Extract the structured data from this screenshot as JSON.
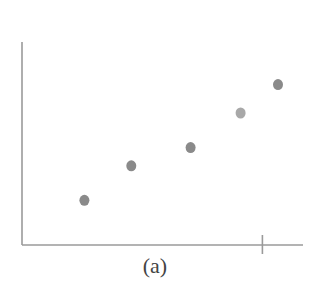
{
  "caption": "(a)",
  "colors": {
    "axis": "#9a9a9a",
    "point": "#8a8a8a",
    "point_highlight": "#a8a8a8",
    "background": "#ffffff"
  },
  "chart_data": {
    "type": "scatter",
    "title": "",
    "caption": "(a)",
    "xlabel": "",
    "ylabel": "",
    "grid": false,
    "legend": null,
    "x_ticks": [
      {
        "x": 7.7,
        "label": ""
      }
    ],
    "points": [
      {
        "x": 2.0,
        "y": 2.2
      },
      {
        "x": 3.5,
        "y": 3.9
      },
      {
        "x": 5.4,
        "y": 4.8
      },
      {
        "x": 7.0,
        "y": 6.5,
        "highlight": true
      },
      {
        "x": 8.2,
        "y": 7.9
      }
    ],
    "xlim": [
      0,
      9
    ],
    "ylim": [
      0,
      10
    ],
    "axis_style": "L-shaped, left and bottom only, no numeric tick labels"
  }
}
